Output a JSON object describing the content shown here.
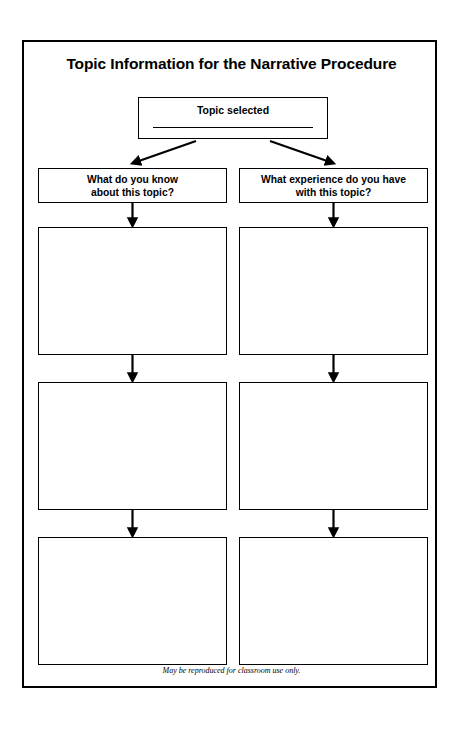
{
  "document": {
    "title": "Topic Information for the Narrative Procedure",
    "footer_note": "May be reproduced for classroom use only."
  },
  "topic": {
    "label": "Topic selected",
    "write_line_value": ""
  },
  "columns": [
    {
      "id": "what-you-know",
      "question": "What do you know\nabout this topic?",
      "answers": [
        "",
        "",
        ""
      ]
    },
    {
      "id": "what-experience",
      "question": "What experience do you have\nwith this topic?",
      "answers": [
        "",
        "",
        ""
      ]
    }
  ],
  "colors": {
    "ink": "#000000",
    "paper": "#ffffff"
  }
}
